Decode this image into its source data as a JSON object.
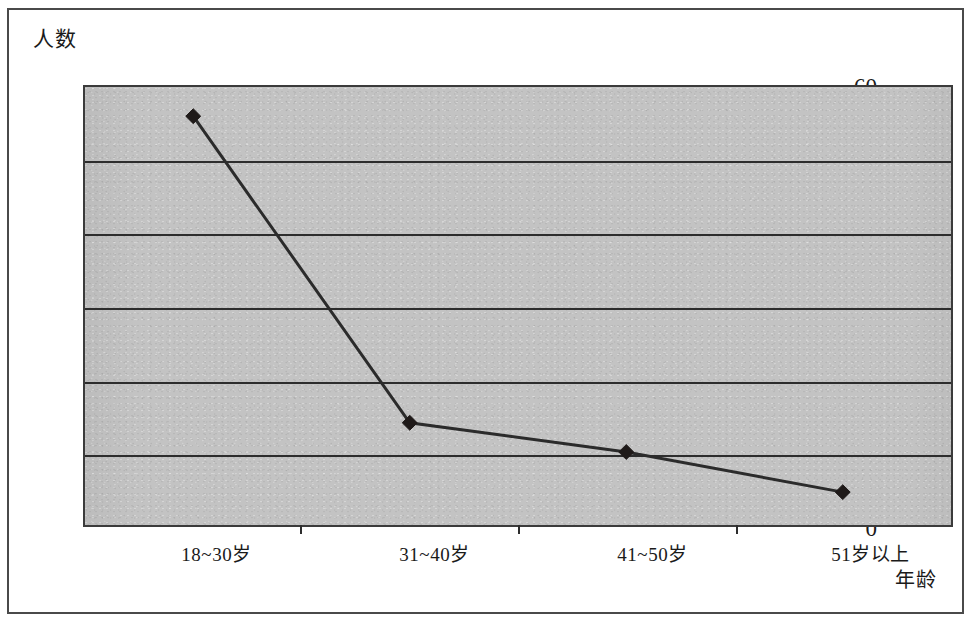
{
  "chart_data": {
    "type": "line",
    "title": "",
    "xlabel": "年龄",
    "ylabel": "人数",
    "categories": [
      "18~30岁",
      "31~40岁",
      "41~50岁",
      "51岁以上"
    ],
    "values": [
      56,
      14,
      10,
      4.5
    ],
    "series": [
      {
        "name": "人数",
        "values": [
          56,
          14,
          10,
          4.5
        ]
      }
    ],
    "ylim": [
      0,
      60
    ],
    "y_ticks": [
      "0",
      "10",
      "20",
      "30",
      "40",
      "50",
      "60"
    ],
    "y_tick_values": [
      0,
      10,
      20,
      30,
      40,
      50,
      60
    ],
    "grid": "horizontal",
    "legend": "none",
    "marker": "diamond",
    "colors": {
      "line": "#2b2b2b",
      "marker": "#1f1a19",
      "plot_background": "#c3c3c3",
      "axis": "#2d2d2d",
      "frame": "#4a4a4a"
    }
  }
}
